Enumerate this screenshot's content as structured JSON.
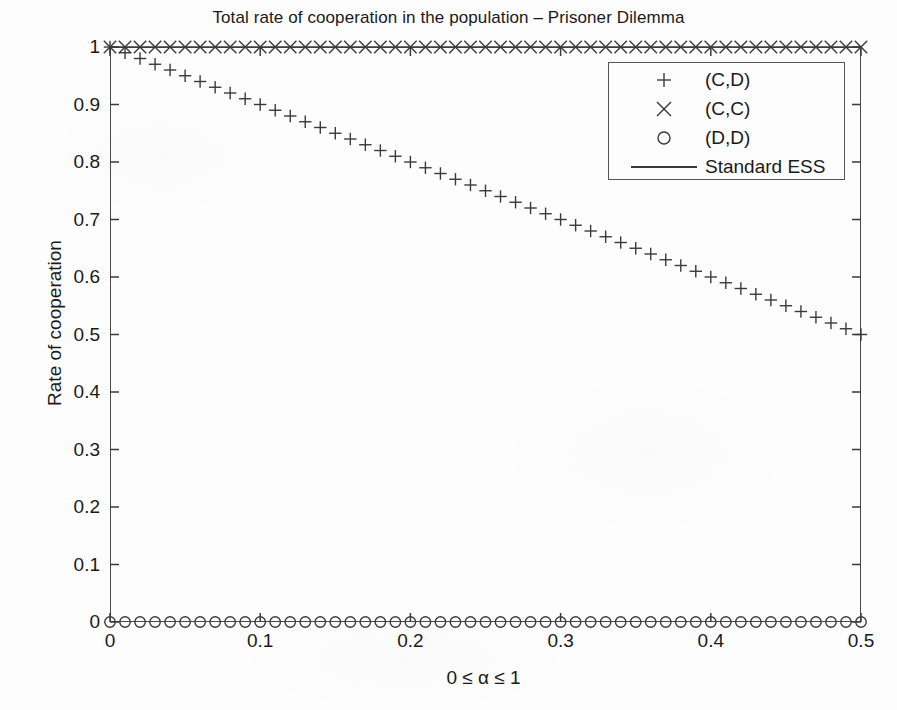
{
  "chart_data": {
    "type": "scatter",
    "title": "Total rate of cooperation in the population – Prisoner Dilemma",
    "xlabel": "0 ≤ α ≤ 1",
    "ylabel": "Rate of cooperation",
    "xlim": [
      0,
      0.5
    ],
    "ylim": [
      0,
      1
    ],
    "xticks": [
      0,
      0.1,
      0.2,
      0.3,
      0.4,
      0.5
    ],
    "xticklabels": [
      "0",
      "0.1",
      "0.2",
      "0.3",
      "0.4",
      "0.5"
    ],
    "yticks": [
      0,
      0.1,
      0.2,
      0.3,
      0.4,
      0.5,
      0.6,
      0.7,
      0.8,
      0.9,
      1
    ],
    "yticklabels": [
      "0",
      "0.1",
      "0.2",
      "0.3",
      "0.4",
      "0.5",
      "0.6",
      "0.7",
      "0.8",
      "0.9",
      "1"
    ],
    "grid": false,
    "legend_position": "upper right",
    "color": "#3a3a3a",
    "series": [
      {
        "name": "(C,D)",
        "marker": "plus",
        "style": "markers",
        "description": "Linear decline from 1.0 at alpha=0 to 0.50 at alpha=0.5",
        "x": [
          0,
          0.01,
          0.02,
          0.03,
          0.04,
          0.05,
          0.06,
          0.07,
          0.08,
          0.09,
          0.1,
          0.11,
          0.12,
          0.13,
          0.14,
          0.15,
          0.16,
          0.17,
          0.18,
          0.19,
          0.2,
          0.21,
          0.22,
          0.23,
          0.24,
          0.25,
          0.26,
          0.27,
          0.28,
          0.29,
          0.3,
          0.31,
          0.32,
          0.33,
          0.34,
          0.35,
          0.36,
          0.37,
          0.38,
          0.39,
          0.4,
          0.41,
          0.42,
          0.43,
          0.44,
          0.45,
          0.46,
          0.47,
          0.48,
          0.49,
          0.5
        ],
        "y": [
          1.0,
          0.99,
          0.98,
          0.97,
          0.96,
          0.95,
          0.94,
          0.93,
          0.92,
          0.91,
          0.9,
          0.89,
          0.88,
          0.87,
          0.86,
          0.85,
          0.84,
          0.83,
          0.82,
          0.81,
          0.8,
          0.79,
          0.78,
          0.77,
          0.76,
          0.75,
          0.74,
          0.73,
          0.72,
          0.71,
          0.7,
          0.69,
          0.68,
          0.67,
          0.66,
          0.65,
          0.64,
          0.63,
          0.62,
          0.61,
          0.6,
          0.59,
          0.58,
          0.57,
          0.56,
          0.55,
          0.54,
          0.53,
          0.52,
          0.51,
          0.5
        ]
      },
      {
        "name": "(C,C)",
        "marker": "cross",
        "style": "markers",
        "description": "Constant at 1.0 across the full alpha range",
        "x": [
          0,
          0.01,
          0.02,
          0.03,
          0.04,
          0.05,
          0.06,
          0.07,
          0.08,
          0.09,
          0.1,
          0.11,
          0.12,
          0.13,
          0.14,
          0.15,
          0.16,
          0.17,
          0.18,
          0.19,
          0.2,
          0.21,
          0.22,
          0.23,
          0.24,
          0.25,
          0.26,
          0.27,
          0.28,
          0.29,
          0.3,
          0.31,
          0.32,
          0.33,
          0.34,
          0.35,
          0.36,
          0.37,
          0.38,
          0.39,
          0.4,
          0.41,
          0.42,
          0.43,
          0.44,
          0.45,
          0.46,
          0.47,
          0.48,
          0.49,
          0.5
        ],
        "y": [
          1,
          1,
          1,
          1,
          1,
          1,
          1,
          1,
          1,
          1,
          1,
          1,
          1,
          1,
          1,
          1,
          1,
          1,
          1,
          1,
          1,
          1,
          1,
          1,
          1,
          1,
          1,
          1,
          1,
          1,
          1,
          1,
          1,
          1,
          1,
          1,
          1,
          1,
          1,
          1,
          1,
          1,
          1,
          1,
          1,
          1,
          1,
          1,
          1,
          1,
          1
        ]
      },
      {
        "name": "(D,D)",
        "marker": "circle",
        "style": "markers",
        "description": "Constant at 0.0 across the full alpha range",
        "x": [
          0,
          0.01,
          0.02,
          0.03,
          0.04,
          0.05,
          0.06,
          0.07,
          0.08,
          0.09,
          0.1,
          0.11,
          0.12,
          0.13,
          0.14,
          0.15,
          0.16,
          0.17,
          0.18,
          0.19,
          0.2,
          0.21,
          0.22,
          0.23,
          0.24,
          0.25,
          0.26,
          0.27,
          0.28,
          0.29,
          0.3,
          0.31,
          0.32,
          0.33,
          0.34,
          0.35,
          0.36,
          0.37,
          0.38,
          0.39,
          0.4,
          0.41,
          0.42,
          0.43,
          0.44,
          0.45,
          0.46,
          0.47,
          0.48,
          0.49,
          0.5
        ],
        "y": [
          0,
          0,
          0,
          0,
          0,
          0,
          0,
          0,
          0,
          0,
          0,
          0,
          0,
          0,
          0,
          0,
          0,
          0,
          0,
          0,
          0,
          0,
          0,
          0,
          0,
          0,
          0,
          0,
          0,
          0,
          0,
          0,
          0,
          0,
          0,
          0,
          0,
          0,
          0,
          0,
          0,
          0,
          0,
          0,
          0,
          0,
          0,
          0,
          0,
          0,
          0
        ]
      },
      {
        "name": "Standard ESS",
        "marker": "none",
        "style": "line",
        "description": "Solid horizontal reference line at 1.0",
        "x": [
          0,
          0.5
        ],
        "y": [
          1,
          1
        ]
      }
    ],
    "legend": [
      {
        "symbol": "plus",
        "label": "(C,D)"
      },
      {
        "symbol": "cross",
        "label": "(C,C)"
      },
      {
        "symbol": "circle",
        "label": "(D,D)"
      },
      {
        "symbol": "line",
        "label": "Standard ESS"
      }
    ]
  }
}
